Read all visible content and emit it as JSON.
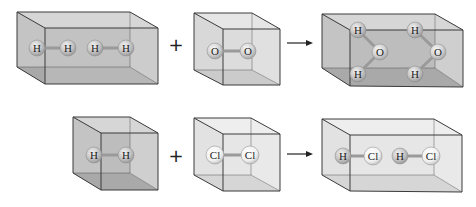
{
  "colors": {
    "box_dark_face": "#b9b9b9",
    "box_dark_front": "#c9c9c9",
    "box_light_face": "#e3e3e3",
    "box_light_front": "#ececec",
    "edge": "#3a3a3a",
    "atom_h": "#c8c8c8",
    "atom_o": "#d4d4d4",
    "atom_cl": "#f2f2f2"
  },
  "rows": [
    {
      "name": "water-formation",
      "reactants": [
        {
          "label": "H2 box",
          "molecules": [
            [
              "H",
              "H"
            ],
            [
              "H",
              "H"
            ]
          ]
        },
        {
          "label": "O2 box",
          "molecules": [
            [
              "O",
              "O"
            ]
          ]
        }
      ],
      "operator": "+",
      "arrow": "→",
      "products": [
        {
          "label": "H2O box",
          "molecules": [
            [
              "H",
              "O",
              "H"
            ],
            [
              "H",
              "O",
              "H"
            ]
          ]
        }
      ]
    },
    {
      "name": "hcl-formation",
      "reactants": [
        {
          "label": "H2 box",
          "molecules": [
            [
              "H",
              "H"
            ]
          ]
        },
        {
          "label": "Cl2 box",
          "molecules": [
            [
              "Cl",
              "Cl"
            ]
          ]
        }
      ],
      "operator": "+",
      "arrow": "→",
      "products": [
        {
          "label": "HCl box",
          "molecules": [
            [
              "H",
              "Cl"
            ],
            [
              "H",
              "Cl"
            ]
          ]
        }
      ]
    }
  ],
  "atoms": {
    "r1_h2_a1": "H",
    "r1_h2_a2": "H",
    "r1_h2_a3": "H",
    "r1_h2_a4": "H",
    "r1_o2_a1": "O",
    "r1_o2_a2": "O",
    "r1_w1_h1": "H",
    "r1_w1_o": "O",
    "r1_w1_h2": "H",
    "r1_w2_h1": "H",
    "r1_w2_o": "O",
    "r1_w2_h2": "H",
    "r2_h2_a1": "H",
    "r2_h2_a2": "H",
    "r2_cl2_a1": "Cl",
    "r2_cl2_a2": "Cl",
    "r2_hcl1_h": "H",
    "r2_hcl1_cl": "Cl",
    "r2_hcl2_h": "H",
    "r2_hcl2_cl": "Cl"
  },
  "operators": {
    "plus_1": "+",
    "plus_2": "+"
  }
}
